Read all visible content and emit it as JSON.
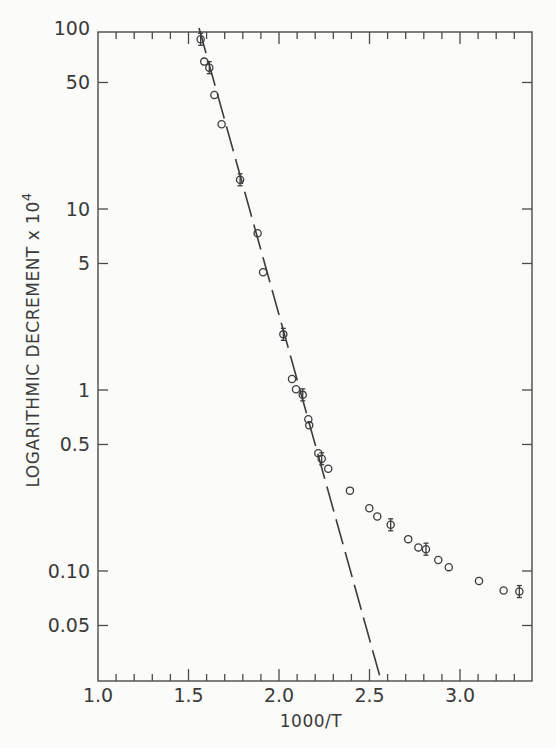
{
  "chart_data": {
    "type": "scatter",
    "title": "",
    "xlabel": "1000/T",
    "ylabel": "LOGARITHMIC DECREMENT x 10",
    "ylabel_superscript": "4",
    "xscale": "linear",
    "yscale": "log",
    "xlim": [
      1.0,
      3.4
    ],
    "ylim": [
      0.025,
      100
    ],
    "grid": false,
    "legend": null,
    "x_ticks": [
      1.0,
      1.5,
      2.0,
      2.5,
      3.0
    ],
    "x_tick_labels": [
      "1.0",
      "1.5",
      "2.0",
      "2.5",
      "3.0"
    ],
    "x_minor_step": 0.1,
    "y_ticks": [
      100,
      50,
      10,
      5,
      1,
      0.5,
      0.1,
      0.05
    ],
    "y_tick_labels": [
      "100",
      "50",
      "10",
      "5",
      "1",
      "0.5",
      "0.10",
      "0.05"
    ],
    "series": [
      {
        "name": "measured",
        "marker": "open-circle",
        "points": [
          {
            "x": 1.567,
            "y": 86.6,
            "err": true
          },
          {
            "x": 1.587,
            "y": 65.2,
            "err": false
          },
          {
            "x": 1.615,
            "y": 60.4,
            "err": true
          },
          {
            "x": 1.643,
            "y": 42.7,
            "err": false
          },
          {
            "x": 1.683,
            "y": 29.4,
            "err": false
          },
          {
            "x": 1.785,
            "y": 14.5,
            "err": true
          },
          {
            "x": 1.882,
            "y": 7.34,
            "err": false
          },
          {
            "x": 1.912,
            "y": 4.47,
            "err": false
          },
          {
            "x": 2.024,
            "y": 2.03,
            "err": true
          },
          {
            "x": 2.072,
            "y": 1.15,
            "err": false
          },
          {
            "x": 2.094,
            "y": 1.01,
            "err": false
          },
          {
            "x": 2.131,
            "y": 0.94,
            "err": true
          },
          {
            "x": 2.162,
            "y": 0.689,
            "err": false
          },
          {
            "x": 2.167,
            "y": 0.638,
            "err": false
          },
          {
            "x": 2.217,
            "y": 0.447,
            "err": false
          },
          {
            "x": 2.236,
            "y": 0.417,
            "err": true
          },
          {
            "x": 2.272,
            "y": 0.367,
            "err": false
          },
          {
            "x": 2.392,
            "y": 0.278,
            "err": false
          },
          {
            "x": 2.499,
            "y": 0.222,
            "err": false
          },
          {
            "x": 2.543,
            "y": 0.2,
            "err": false
          },
          {
            "x": 2.617,
            "y": 0.18,
            "err": true
          },
          {
            "x": 2.714,
            "y": 0.15,
            "err": false
          },
          {
            "x": 2.77,
            "y": 0.135,
            "err": false
          },
          {
            "x": 2.812,
            "y": 0.132,
            "err": true
          },
          {
            "x": 2.88,
            "y": 0.115,
            "err": false
          },
          {
            "x": 2.938,
            "y": 0.105,
            "err": false
          },
          {
            "x": 3.105,
            "y": 0.088,
            "err": false
          },
          {
            "x": 3.241,
            "y": 0.078,
            "err": false
          },
          {
            "x": 3.328,
            "y": 0.077,
            "err": true
          }
        ]
      },
      {
        "name": "extrapolated fit",
        "style": "long-dash line",
        "points": [
          {
            "x": 1.558,
            "y": 100
          },
          {
            "x": 2.558,
            "y": 0.026
          }
        ]
      }
    ]
  },
  "layout": {
    "plot_left": 98,
    "plot_right": 532,
    "plot_top": 32,
    "plot_bottom": 681,
    "y_decade_px": 181,
    "y_at_1_px": 390,
    "x_unit_px": 181
  }
}
